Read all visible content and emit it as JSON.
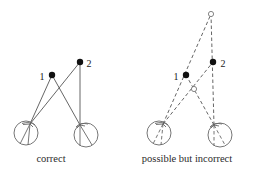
{
  "colors": {
    "line": "#555555",
    "point_fill": "#111111",
    "hollow_point_stroke": "#777777",
    "eye_stroke": "#666666",
    "text": "#222222"
  },
  "panels": [
    {
      "id": "correct",
      "caption": "correct",
      "points": [
        {
          "label": "1",
          "x": 52,
          "y": 75,
          "kind": "solid"
        },
        {
          "label": "2",
          "x": 80,
          "y": 62,
          "kind": "solid"
        }
      ],
      "eyes": [
        {
          "name": "left-eye",
          "cx": 26,
          "cy": 133,
          "r": 12,
          "lens_x": 30,
          "lens_y": 124
        },
        {
          "name": "right-eye",
          "cx": 86,
          "cy": 135,
          "r": 12,
          "lens_x": 80,
          "lens_y": 125
        }
      ],
      "line_style": "solid"
    },
    {
      "id": "possible-but-incorrect",
      "caption": "possible but incorrect",
      "points": [
        {
          "label": "1",
          "x": 186,
          "y": 75,
          "kind": "solid"
        },
        {
          "label": "2",
          "x": 213,
          "y": 62,
          "kind": "solid"
        },
        {
          "label": "",
          "x": 211,
          "y": 14,
          "kind": "hollow"
        },
        {
          "label": "",
          "x": 194,
          "y": 89,
          "kind": "hollow"
        }
      ],
      "eyes": [
        {
          "name": "left-eye",
          "cx": 159,
          "cy": 133,
          "r": 12,
          "lens_x": 163,
          "lens_y": 124
        },
        {
          "name": "right-eye",
          "cx": 220,
          "cy": 135,
          "r": 12,
          "lens_x": 214,
          "lens_y": 125
        }
      ],
      "line_style": "dashed"
    }
  ]
}
